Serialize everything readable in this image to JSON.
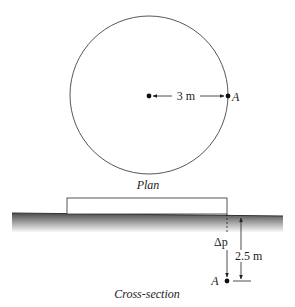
{
  "plan": {
    "caption": "Plan",
    "radius_label": "3 m",
    "point_label": "A",
    "circle": {
      "cx": 149,
      "cy": 95,
      "r": 79
    }
  },
  "cross_section": {
    "caption": "Cross-section",
    "depth_label": "2.5 m",
    "stress_label": "Δp",
    "point_label": "A"
  },
  "colors": {
    "line": "#333333",
    "ground_dark": "#555555",
    "ground_light": "#f4f4f4"
  }
}
